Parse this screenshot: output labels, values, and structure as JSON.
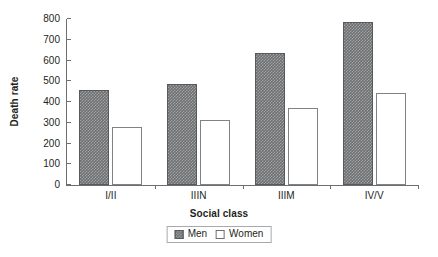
{
  "chart_data": {
    "type": "bar",
    "title": "",
    "xlabel": "Social class",
    "ylabel": "Death rate",
    "categories": [
      "I/II",
      "IIIN",
      "IIIM",
      "IV/V"
    ],
    "series": [
      {
        "name": "Men",
        "values": [
          460,
          488,
          637,
          785
        ],
        "color": "#6f7072",
        "style": "filled-hatched"
      },
      {
        "name": "Women",
        "values": [
          278,
          311,
          369,
          445
        ],
        "color": "#ffffff",
        "style": "outlined"
      }
    ],
    "ylim": [
      0,
      800
    ],
    "yticks": [
      0,
      100,
      200,
      300,
      400,
      500,
      600,
      700,
      800
    ],
    "ytick_labels": [
      "0",
      "100",
      "200",
      "300",
      "400",
      "500",
      "600",
      "700",
      "800"
    ],
    "grid": false,
    "legend_position": "bottom-center",
    "axis_color": "#6d6e71"
  },
  "legend": {
    "entries": [
      {
        "label": "Men",
        "swatch": "filled-swatch"
      },
      {
        "label": "Women",
        "swatch": "outlined-swatch"
      }
    ]
  }
}
